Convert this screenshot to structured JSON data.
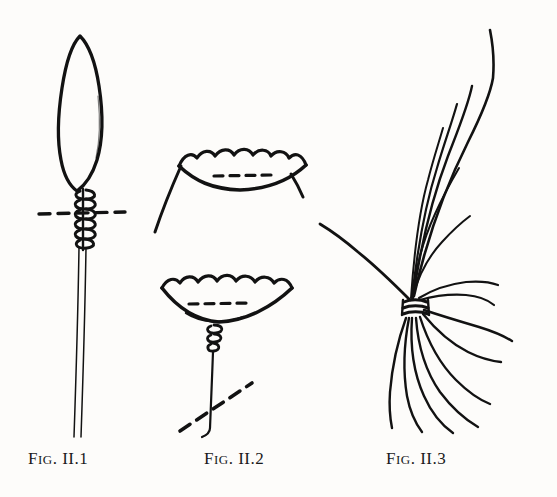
{
  "plate": {
    "width": 557,
    "height": 497,
    "background_color": "#fdfcfa",
    "ink_color": "#121212",
    "medium": "pen-and-ink line drawing, scanned book plate"
  },
  "figures": [
    {
      "id": "fig-1",
      "caption_lead": "F",
      "caption_small": "IG",
      "caption_rest": ". II.1",
      "caption_full": "FIG. II.1",
      "subject": "lanceolate blade bound with spiral coil lashing on a long slender shaft",
      "parts": [
        "leaf-shaped blade outline",
        "spiral coil binding",
        "horizontal dashed section line",
        "long double-line shaft"
      ]
    },
    {
      "id": "fig-2",
      "caption_lead": "F",
      "caption_small": "IG",
      "caption_rest": ". II.2",
      "caption_full": "FIG. II.2",
      "subject": "two scalloped-rim cup forms, upper shallow bowl and lower deep bowl on a stem",
      "parts": [
        "upper scalloped cup with dashed chord",
        "curved stalk below upper cup",
        "lower scalloped cup with dashed chord",
        "small coil knot",
        "straight vertical stem",
        "diagonal dashed line"
      ]
    },
    {
      "id": "fig-3",
      "caption_lead": "F",
      "caption_small": "IG",
      "caption_rest": ". II.3",
      "caption_full": "FIG. II.3",
      "subject": "bundle of long fibres gathered and lashed at a central band, splaying above and below",
      "parts": [
        "upswept fibre strands",
        "central lashing band",
        "downswept fanned strands",
        "lateral strand to the left"
      ]
    }
  ]
}
